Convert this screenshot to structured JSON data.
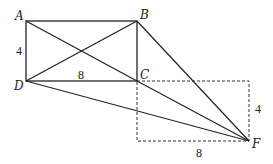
{
  "diagram": {
    "points": {
      "A": {
        "label": "A",
        "x": 26,
        "y": 21
      },
      "B": {
        "label": "B",
        "x": 137,
        "y": 21
      },
      "C": {
        "label": "C",
        "x": 137,
        "y": 81
      },
      "D": {
        "label": "D",
        "x": 26,
        "y": 81
      },
      "F": {
        "label": "F",
        "x": 249,
        "y": 141
      }
    },
    "dimension_labels": {
      "AD": "4",
      "DC": "8",
      "right_side": "4",
      "bottom_side": "8"
    },
    "solid_segments": [
      "AB",
      "BC",
      "CD",
      "DA",
      "AC",
      "BD",
      "BF",
      "CF",
      "DF"
    ],
    "dashed_rectangle": [
      "C",
      "F"
    ],
    "colors": {
      "stroke": "#222222",
      "background": "#ffffff"
    }
  }
}
